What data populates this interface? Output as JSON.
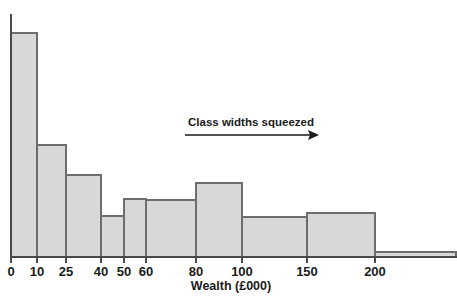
{
  "figure": {
    "name": "wealth-distribution-histogram",
    "background_color": "#ffffff",
    "bar_fill_color": "#d8d8d8",
    "bar_stroke_color": "#6d6d6d",
    "axis_color": "#4a4a4a",
    "text_color": "#1a1a1a"
  },
  "annotation": {
    "text": "Class widths squeezed",
    "arrow_direction": "right"
  },
  "chart_data": {
    "type": "bar",
    "subtype": "histogram-unequal-class-widths",
    "title": "",
    "xlabel": "Wealth (£000)",
    "ylabel": "",
    "grid": false,
    "legend": null,
    "xlim": [
      0,
      250
    ],
    "ylim": [
      0,
      1.0
    ],
    "x_tick_labels": [
      "0",
      "10",
      "25",
      "40",
      "50",
      "60",
      "80",
      "100",
      "150",
      "200"
    ],
    "x_tick_values": [
      0,
      10,
      25,
      40,
      50,
      60,
      80,
      100,
      150,
      200
    ],
    "y_axis_visible": true,
    "y_tick_labels": [],
    "bin_edges": [
      0,
      10,
      25,
      40,
      50,
      60,
      80,
      100,
      150,
      200,
      250
    ],
    "bins": [
      {
        "label": "0–10",
        "x0": 0,
        "x1": 10,
        "height": 1.0
      },
      {
        "label": "10–25",
        "x0": 10,
        "x1": 25,
        "height": 0.5
      },
      {
        "label": "25–40",
        "x0": 25,
        "x1": 40,
        "height": 0.366
      },
      {
        "label": "40–50",
        "x0": 40,
        "x1": 50,
        "height": 0.183
      },
      {
        "label": "50–60",
        "x0": 50,
        "x1": 60,
        "height": 0.259
      },
      {
        "label": "60–80",
        "x0": 60,
        "x1": 80,
        "height": 0.254
      },
      {
        "label": "80–100",
        "x0": 80,
        "x1": 100,
        "height": 0.33
      },
      {
        "label": "100–150",
        "x0": 100,
        "x1": 150,
        "height": 0.179
      },
      {
        "label": "150–200",
        "x0": 150,
        "x1": 200,
        "height": 0.196
      },
      {
        "label": "200+",
        "x0": 200,
        "x1": 250,
        "height": 0.022
      }
    ],
    "annotations": [
      {
        "text": "Class widths squeezed",
        "x_start": 20,
        "x_end": 110,
        "type": "arrow-right"
      }
    ]
  }
}
